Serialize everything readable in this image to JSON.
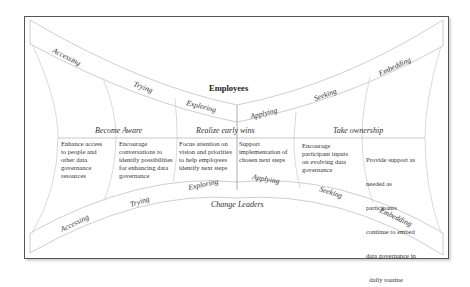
{
  "diagram": {
    "top_group": "Employees",
    "bottom_group": "Change Leaders",
    "top_band_stages": [
      "Accessing",
      "Trying",
      "Exploring",
      "Applying",
      "Seeking",
      "Embedding"
    ],
    "bottom_band_stages": [
      "Accessing",
      "Trying",
      "Exploring",
      "Applying",
      "Seeking",
      "Embedding"
    ],
    "phases": [
      {
        "label": "Become Aware"
      },
      {
        "label": "Realize early wins"
      },
      {
        "label": "Take ownership"
      }
    ],
    "actions": [
      {
        "lines": [
          "Enhance access",
          "to people and",
          "other data",
          "governance",
          "resources"
        ]
      },
      {
        "lines": [
          "Encourage",
          "conversations to",
          "identify possibilities",
          "for enhancing data",
          "governance"
        ]
      },
      {
        "lines": [
          "Focus attention on",
          "vision and priorities",
          "to help employees",
          "identify next steps"
        ]
      },
      {
        "lines": [
          "Support",
          "implementation of",
          "chosen next steps"
        ]
      },
      {
        "lines": [
          "Encourage",
          "participant inputs",
          "on evolving data",
          "governance"
        ]
      },
      {
        "lines": [
          "Provide support as",
          "needed as",
          "participants",
          "continue to embed",
          "data governance in",
          "  daily routine"
        ]
      }
    ],
    "colors": {
      "line": "#c8c8c8",
      "frame": "#555555",
      "text": "#333333"
    }
  }
}
